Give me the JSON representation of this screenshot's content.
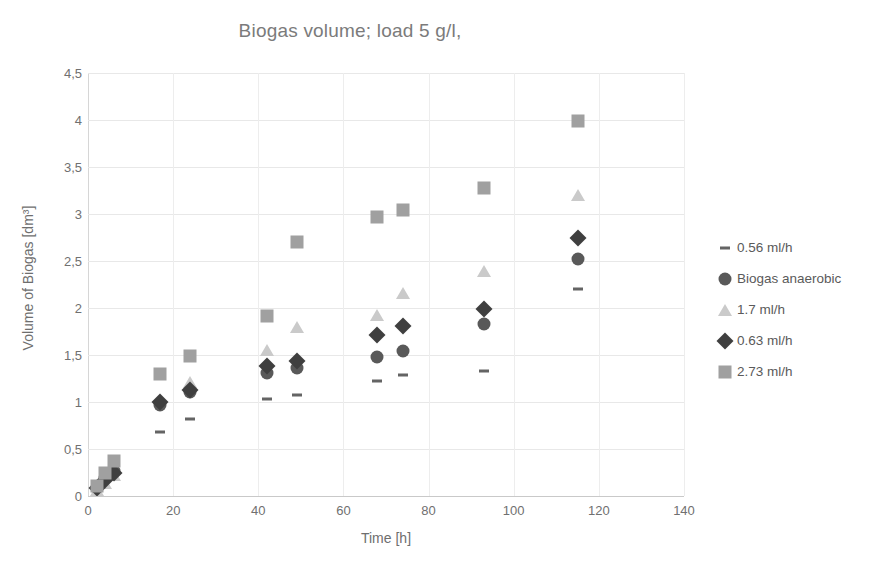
{
  "chart_data": {
    "type": "scatter",
    "title": "Biogas volume; load 5 g/l,",
    "xlabel": "Time [h]",
    "ylabel": "Volume of Biogas [dm³]",
    "xlim": [
      0,
      140
    ],
    "ylim": [
      0,
      4.5
    ],
    "xticks": [
      "0",
      "20",
      "40",
      "60",
      "80",
      "100",
      "120",
      "140"
    ],
    "yticks": [
      "0",
      "0,5",
      "1",
      "1,5",
      "2",
      "2,5",
      "3",
      "3,5",
      "4",
      "4,5"
    ],
    "xtick_values": [
      0,
      20,
      40,
      60,
      80,
      100,
      120,
      140
    ],
    "ytick_values": [
      0,
      0.5,
      1,
      1.5,
      2,
      2.5,
      3,
      3.5,
      4,
      4.5
    ],
    "grid": true,
    "legend_position": "right",
    "decimal_separator": ",",
    "series": [
      {
        "name": "0.56 ml/h",
        "marker": "dash",
        "color": "#646464",
        "points": [
          {
            "x": 2,
            "y": 0.05
          },
          {
            "x": 4,
            "y": 0.1
          },
          {
            "x": 17,
            "y": 0.68
          },
          {
            "x": 24,
            "y": 0.82
          },
          {
            "x": 42,
            "y": 1.03
          },
          {
            "x": 49,
            "y": 1.07
          },
          {
            "x": 68,
            "y": 1.22
          },
          {
            "x": 74,
            "y": 1.29
          },
          {
            "x": 93,
            "y": 1.33
          },
          {
            "x": 115,
            "y": 2.2
          }
        ]
      },
      {
        "name": "Biogas anaerobic",
        "marker": "circle",
        "color": "#595959",
        "points": [
          {
            "x": 2,
            "y": 0.09
          },
          {
            "x": 4,
            "y": 0.19
          },
          {
            "x": 6,
            "y": 0.27
          },
          {
            "x": 17,
            "y": 0.97
          },
          {
            "x": 24,
            "y": 1.11
          },
          {
            "x": 42,
            "y": 1.31
          },
          {
            "x": 49,
            "y": 1.36
          },
          {
            "x": 68,
            "y": 1.48
          },
          {
            "x": 74,
            "y": 1.54
          },
          {
            "x": 93,
            "y": 1.83
          },
          {
            "x": 115,
            "y": 2.52
          }
        ]
      },
      {
        "name": "1.7 ml/h",
        "marker": "triangle",
        "color": "#cacaca",
        "points": [
          {
            "x": 2,
            "y": 0.06
          },
          {
            "x": 4,
            "y": 0.14
          },
          {
            "x": 6,
            "y": 0.22
          },
          {
            "x": 24,
            "y": 1.21
          },
          {
            "x": 42,
            "y": 1.55
          },
          {
            "x": 49,
            "y": 1.8
          },
          {
            "x": 68,
            "y": 1.93
          },
          {
            "x": 74,
            "y": 2.16
          },
          {
            "x": 93,
            "y": 2.39
          },
          {
            "x": 115,
            "y": 3.2
          }
        ]
      },
      {
        "name": "0.63 ml/h",
        "marker": "diamond",
        "color": "#3f3f3f",
        "points": [
          {
            "x": 2,
            "y": 0.08
          },
          {
            "x": 4,
            "y": 0.17
          },
          {
            "x": 6,
            "y": 0.25
          },
          {
            "x": 17,
            "y": 1.0
          },
          {
            "x": 24,
            "y": 1.13
          },
          {
            "x": 42,
            "y": 1.38
          },
          {
            "x": 49,
            "y": 1.44
          },
          {
            "x": 68,
            "y": 1.71
          },
          {
            "x": 74,
            "y": 1.81
          },
          {
            "x": 93,
            "y": 1.99
          },
          {
            "x": 115,
            "y": 2.75
          }
        ]
      },
      {
        "name": "2.73 ml/h",
        "marker": "square",
        "color": "#a0a0a0",
        "points": [
          {
            "x": 2,
            "y": 0.11
          },
          {
            "x": 4,
            "y": 0.24
          },
          {
            "x": 6,
            "y": 0.37
          },
          {
            "x": 17,
            "y": 1.3
          },
          {
            "x": 24,
            "y": 1.49
          },
          {
            "x": 42,
            "y": 1.92
          },
          {
            "x": 49,
            "y": 2.7
          },
          {
            "x": 68,
            "y": 2.97
          },
          {
            "x": 74,
            "y": 3.04
          },
          {
            "x": 93,
            "y": 3.28
          },
          {
            "x": 115,
            "y": 3.99
          }
        ]
      }
    ]
  },
  "legend": {
    "items": [
      {
        "label": "0.56 ml/h",
        "marker": "dash"
      },
      {
        "label": "Biogas anaerobic",
        "marker": "circle"
      },
      {
        "label": "1.7 ml/h",
        "marker": "triangle"
      },
      {
        "label": "0.63 ml/h",
        "marker": "diamond"
      },
      {
        "label": "2.73 ml/h",
        "marker": "square"
      }
    ]
  }
}
